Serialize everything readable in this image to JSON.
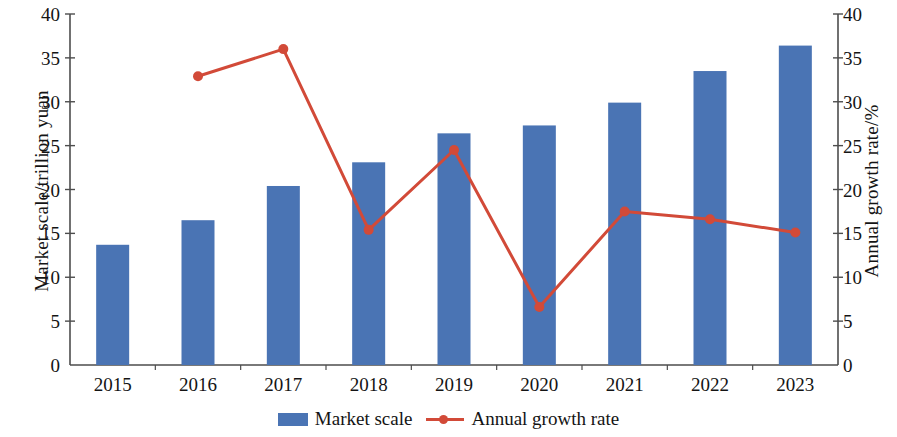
{
  "chart_data": {
    "type": "bar",
    "title": "",
    "categories": [
      "2015",
      "2016",
      "2017",
      "2018",
      "2019",
      "2020",
      "2021",
      "2022",
      "2023"
    ],
    "xlabel": "",
    "ylabel": "Market scale/trillion yuan",
    "y2label": "Annual growth rate/%",
    "ylim": [
      0,
      40
    ],
    "y2lim": [
      0,
      40
    ],
    "yticks": [
      0,
      5,
      10,
      15,
      20,
      25,
      30,
      35,
      40
    ],
    "y2ticks": [
      0,
      5,
      10,
      15,
      20,
      25,
      30,
      35,
      40
    ],
    "grid": false,
    "legend_position": "bottom-center",
    "series": [
      {
        "name": "Market scale",
        "type": "bar",
        "axis": "left",
        "color": "#4a74b4",
        "values": [
          13.7,
          16.5,
          20.4,
          23.1,
          26.4,
          27.3,
          29.9,
          33.5,
          36.4
        ]
      },
      {
        "name": "Annual growth rate",
        "type": "line",
        "axis": "right",
        "color": "#d24a38",
        "marker": "circle",
        "values": [
          null,
          32.9,
          36.0,
          15.4,
          24.5,
          6.6,
          17.5,
          16.6,
          15.1
        ]
      }
    ]
  },
  "axis": {
    "left_title": "Market scale/trillion yuan",
    "right_title": "Annual growth rate/%",
    "left_ticks": [
      "0",
      "5",
      "10",
      "15",
      "20",
      "25",
      "30",
      "35",
      "40"
    ],
    "right_ticks": [
      "0",
      "5",
      "10",
      "15",
      "20",
      "25",
      "30",
      "35",
      "40"
    ],
    "x_ticks": [
      "2015",
      "2016",
      "2017",
      "2018",
      "2019",
      "2020",
      "2021",
      "2022",
      "2023"
    ]
  },
  "legend": {
    "items": [
      {
        "label": "Market scale",
        "color": "#4a74b4",
        "marker": "bar"
      },
      {
        "label": "Annual growth rate",
        "color": "#d24a38",
        "marker": "line-circle"
      }
    ]
  },
  "colors": {
    "bar": "#4a74b4",
    "line": "#d24a38",
    "axis": "#4d4d4d",
    "text": "#141414",
    "background": "#ffffff"
  }
}
